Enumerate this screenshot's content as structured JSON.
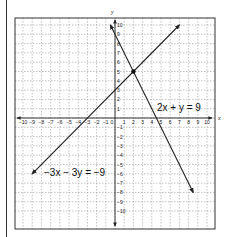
{
  "chart_data": {
    "type": "line",
    "title": "",
    "xlabel": "x",
    "ylabel": "y",
    "xlim": [
      -10,
      10
    ],
    "ylim": [
      -10,
      10
    ],
    "grid": true,
    "grid_style": "dashed",
    "x_ticks": [
      "-10",
      "-9",
      "-8",
      "-7",
      "-6",
      "-5",
      "-4",
      "-3",
      "-2",
      "-1",
      "0",
      "1",
      "2",
      "3",
      "4",
      "5",
      "6",
      "7",
      "8",
      "9",
      "10"
    ],
    "y_ticks": [
      "10",
      "9",
      "8",
      "7",
      "6",
      "5",
      "4",
      "3",
      "2",
      "1",
      "-1",
      "-2",
      "-3",
      "-4",
      "-5",
      "-6",
      "-7",
      "-8",
      "-9",
      "-10"
    ],
    "series": [
      {
        "name": "2x + y = 9",
        "label": "2x + y = 9",
        "equation": "y = -2x + 9",
        "points": [
          [
            -0.5,
            10
          ],
          [
            8.5,
            -8
          ]
        ],
        "arrows": "both"
      },
      {
        "name": "-3x - 3y = -9",
        "label": "−3x − 3y = −9",
        "equation": "y = x + 3",
        "points": [
          [
            -9,
            -6
          ],
          [
            7,
            10
          ]
        ],
        "arrows": "both"
      }
    ],
    "annotations": [
      {
        "type": "point",
        "x": 2,
        "y": 5,
        "label": "intersection"
      },
      {
        "type": "text",
        "text": "2x + y = 9",
        "near": [
          5,
          2
        ]
      },
      {
        "type": "text",
        "text": "−3x − 3y = −9",
        "near": [
          -6,
          -5
        ]
      }
    ]
  },
  "labels": {
    "x_axis": "x",
    "y_axis": "y",
    "eq1": "2x + y = 9",
    "eq2": "−3x − 3y = −9"
  }
}
